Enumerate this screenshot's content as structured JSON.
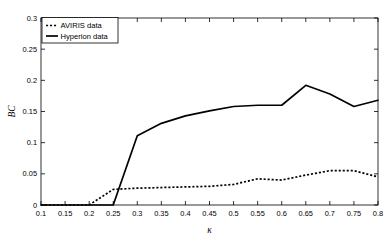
{
  "chart_data": {
    "type": "line",
    "title": "",
    "xlabel": "κ",
    "ylabel": "BC",
    "xlim": [
      0.1,
      0.8
    ],
    "ylim": [
      0,
      0.3
    ],
    "grid": false,
    "legend_position": "top-left",
    "xticks": [
      0.1,
      0.15,
      0.2,
      0.25,
      0.3,
      0.35,
      0.4,
      0.45,
      0.5,
      0.55,
      0.6,
      0.65,
      0.7,
      0.75,
      0.8
    ],
    "xtick_labels": [
      "0.1",
      "0.15",
      "0.2",
      "0.25",
      "0.3",
      "0.35",
      "0.4",
      "0.45",
      "0.5",
      "0.55",
      "0.6",
      "0.65",
      "0.7",
      "0.75",
      "0.8"
    ],
    "yticks": [
      0,
      0.05,
      0.1,
      0.15,
      0.2,
      0.25,
      0.3
    ],
    "ytick_labels": [
      "0",
      "0.05",
      "0.1",
      "0.15",
      "0.2",
      "0.25",
      "0.3"
    ],
    "x": [
      0.1,
      0.15,
      0.2,
      0.25,
      0.3,
      0.35,
      0.4,
      0.45,
      0.5,
      0.55,
      0.6,
      0.65,
      0.7,
      0.75,
      0.8
    ],
    "series": [
      {
        "name": "AVIRIS data",
        "style": "dotted",
        "values": [
          0,
          0,
          0,
          0.025,
          0.027,
          0.028,
          0.029,
          0.03,
          0.033,
          0.042,
          0.04,
          0.048,
          0.055,
          0.055,
          0.045
        ]
      },
      {
        "name": "Hyperion data",
        "style": "solid",
        "values": [
          0,
          0,
          0,
          0,
          0.111,
          0.131,
          0.143,
          0.151,
          0.158,
          0.16,
          0.16,
          0.192,
          0.178,
          0.158,
          0.168
        ]
      }
    ]
  },
  "legend": {
    "entries": [
      {
        "label": "AVIRIS data",
        "style": "dotted"
      },
      {
        "label": "Hyperion data",
        "style": "solid"
      }
    ]
  },
  "axes": {
    "x_title": "κ",
    "y_title": "BC"
  }
}
